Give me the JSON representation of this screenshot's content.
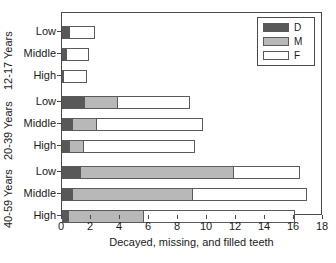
{
  "chart_data": {
    "type": "bar",
    "orientation": "horizontal",
    "stacked": true,
    "title": "",
    "xlabel": "Decayed, missing, and filled teeth",
    "ylabel": "",
    "xlim": [
      0,
      18
    ],
    "xticks": [
      0,
      2,
      4,
      6,
      8,
      10,
      12,
      14,
      16,
      18
    ],
    "xticklabels": [
      "0",
      "2",
      "4",
      "6",
      "8",
      "10",
      "12",
      "14",
      "16",
      "18"
    ],
    "grid": false,
    "legend": {
      "position": "top-right",
      "entries": [
        {
          "name": "D",
          "color": "#585858"
        },
        {
          "name": "M",
          "color": "#b8b8b8"
        },
        {
          "name": "F",
          "color": "#ffffff"
        }
      ]
    },
    "series": [
      {
        "name": "D",
        "color": "#585858",
        "values": [
          0.5,
          0.25,
          0.1,
          1.5,
          0.7,
          0.45,
          1.25,
          0.7,
          0.4
        ]
      },
      {
        "name": "M",
        "color": "#b8b8b8",
        "values": [
          0.0,
          0.0,
          0.0,
          2.3,
          1.65,
          1.0,
          10.55,
          8.3,
          5.2
        ]
      },
      {
        "name": "F",
        "color": "#ffffff",
        "values": [
          1.8,
          1.6,
          1.6,
          5.05,
          7.35,
          7.75,
          4.6,
          7.9,
          10.5
        ]
      }
    ],
    "categories": [
      "Low",
      "Middle",
      "High",
      "Low",
      "Middle",
      "High",
      "Low",
      "Middle",
      "High"
    ],
    "groups": [
      {
        "label": "12-17 Years",
        "rows": [
          {
            "category": "Low",
            "D": 0.5,
            "M": 0.0,
            "F": 1.8,
            "total": 2.3
          },
          {
            "category": "Middle",
            "D": 0.25,
            "M": 0.0,
            "F": 1.6,
            "total": 1.85
          },
          {
            "category": "High",
            "D": 0.1,
            "M": 0.0,
            "F": 1.6,
            "total": 1.7
          }
        ]
      },
      {
        "label": "20-39 Years",
        "rows": [
          {
            "category": "Low",
            "D": 1.5,
            "M": 2.3,
            "F": 5.05,
            "total": 8.85
          },
          {
            "category": "Middle",
            "D": 0.7,
            "M": 1.65,
            "F": 7.35,
            "total": 9.7
          },
          {
            "category": "High",
            "D": 0.45,
            "M": 1.0,
            "F": 7.75,
            "total": 9.2
          }
        ]
      },
      {
        "label": "40-59 Years",
        "rows": [
          {
            "category": "Low",
            "D": 1.25,
            "M": 10.55,
            "F": 4.6,
            "total": 16.4
          },
          {
            "category": "Middle",
            "D": 0.7,
            "M": 8.3,
            "F": 7.9,
            "total": 16.9
          },
          {
            "category": "High",
            "D": 0.4,
            "M": 5.2,
            "F": 10.5,
            "total": 16.1
          }
        ]
      }
    ]
  },
  "axis": {
    "x_title": "Decayed, missing, and filled teeth"
  },
  "ytick_labels": [
    "Low",
    "Middle",
    "High",
    "Low",
    "Middle",
    "High",
    "Low",
    "Middle",
    "High"
  ],
  "group_labels": [
    "12-17 Years",
    "20-39 Years",
    "40-59 Years"
  ],
  "legend_labels": [
    "D",
    "M",
    "F"
  ],
  "colors": {
    "decayed": "#585858",
    "missing": "#b8b8b8",
    "filled": "#ffffff",
    "outline": "#5a5a5a",
    "axis": "#4a4a4a",
    "text": "#1a1a1a"
  }
}
